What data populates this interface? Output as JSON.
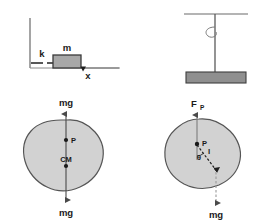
{
  "figure": {
    "background_color": "#ffffff",
    "stroke_color": "#4a4a4a",
    "text_color": "#1a1a1a",
    "blob_fill": "#d2d2d2",
    "blob_stroke": "#555555",
    "block_fill": "#a8a8a8",
    "block_stroke": "#3a3a3a"
  },
  "panels": {
    "spring_mass": {
      "name": "spring-mass-on-surface",
      "labels": {
        "spring_constant": "k",
        "mass": "m",
        "axis": "x"
      }
    },
    "pendulum_rod": {
      "name": "pivoted-bar-from-ceiling",
      "labels": {}
    },
    "blob_left": {
      "name": "rigid-body-gravity-diagram",
      "labels": {
        "force_top": "mg",
        "pivot_point": "P",
        "center_of_mass": "CM",
        "force_bottom": "mg"
      }
    },
    "blob_right": {
      "name": "rigid-body-pivot-force-diagram",
      "labels": {
        "pivot_force": "F",
        "pivot_force_sub": "P",
        "pivot_point": "P",
        "angle": "θ",
        "distance": "l",
        "weight": "mg"
      }
    }
  }
}
